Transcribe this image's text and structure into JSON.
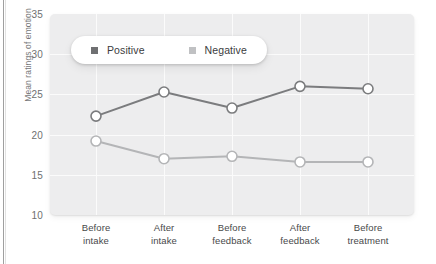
{
  "chart_data": {
    "type": "line",
    "title": "",
    "xlabel": "",
    "ylabel": "Mean ratings of emotion",
    "categories": [
      "Before intake",
      "After intake",
      "Before feedback",
      "After feedback",
      "Before treatment"
    ],
    "category_lines": [
      [
        "Before",
        "intake"
      ],
      [
        "After",
        "intake"
      ],
      [
        "Before",
        "feedback"
      ],
      [
        "After",
        "feedback"
      ],
      [
        "Before",
        "treatment"
      ]
    ],
    "series": [
      {
        "name": "Positive",
        "color": "#7b7c7e",
        "values": [
          22.3,
          25.3,
          23.3,
          26.0,
          25.7
        ]
      },
      {
        "name": "Negative",
        "color": "#b4b5b7",
        "values": [
          19.2,
          17.0,
          17.3,
          16.6,
          16.6
        ]
      }
    ],
    "ylim": [
      10,
      35
    ],
    "yticks": [
      35,
      30,
      25,
      20,
      15,
      10
    ],
    "ytick_labels": [
      "35",
      "30",
      "25",
      "20",
      "15",
      "10"
    ],
    "grid": true,
    "grid_color": "#fbfbfb",
    "plot_background": "#ededee",
    "legend_position": "top-left-inside",
    "marker": "open-circle",
    "marker_face_color": "#ffffff"
  },
  "legend": {
    "items": [
      {
        "label": "Positive",
        "swatch_color": "#6f7072",
        "icon": "square-swatch-icon"
      },
      {
        "label": "Negative",
        "swatch_color": "#c0c1c3",
        "icon": "square-swatch-icon"
      }
    ]
  }
}
